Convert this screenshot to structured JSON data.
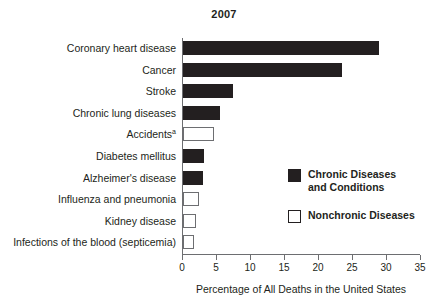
{
  "chart_data": {
    "type": "bar",
    "orientation": "horizontal",
    "title": "2007",
    "xlabel": "Percentage of All Deaths in the United States",
    "ylabel": "",
    "xlim": [
      0,
      35
    ],
    "xticks": [
      0,
      5,
      10,
      15,
      20,
      25,
      30,
      35
    ],
    "xtick_labels": [
      "0",
      "5",
      "10",
      "15",
      "20",
      "25",
      "30",
      "35"
    ],
    "grid": false,
    "legend_position": "right-middle",
    "categories": [
      "Coronary heart disease",
      "Cancer",
      "Stroke",
      "Chronic lung diseases",
      "Accidents",
      "Diabetes mellitus",
      "Alzheimer's disease",
      "Influenza and pneumonia",
      "Kidney disease",
      "Infections of the blood (septicemia)"
    ],
    "category_footnotes": [
      "",
      "",
      "",
      "",
      "a",
      "",
      "",
      "",
      "",
      ""
    ],
    "values": [
      28.8,
      23.4,
      7.3,
      5.4,
      4.6,
      3.1,
      2.9,
      2.4,
      1.9,
      1.6
    ],
    "point_groups": [
      "chronic",
      "chronic",
      "chronic",
      "chronic",
      "nonchronic",
      "chronic",
      "chronic",
      "nonchronic",
      "nonchronic",
      "nonchronic"
    ],
    "series": [
      {
        "name": "Chronic Diseases and Conditions",
        "key": "chronic",
        "color": "#231f20",
        "fill": "solid"
      },
      {
        "name": "Nonchronic Diseases",
        "key": "nonchronic",
        "color": "#ffffff",
        "fill": "open"
      }
    ],
    "legend": [
      {
        "label_line1": "Chronic Diseases",
        "label_line2": "and Conditions",
        "swatch": "chronic"
      },
      {
        "label_line1": "Nonchronic Diseases",
        "label_line2": "",
        "swatch": "nonchronic"
      }
    ]
  },
  "colors": {
    "ink": "#231f20",
    "axis": "#6d6e71",
    "background": "#ffffff"
  }
}
